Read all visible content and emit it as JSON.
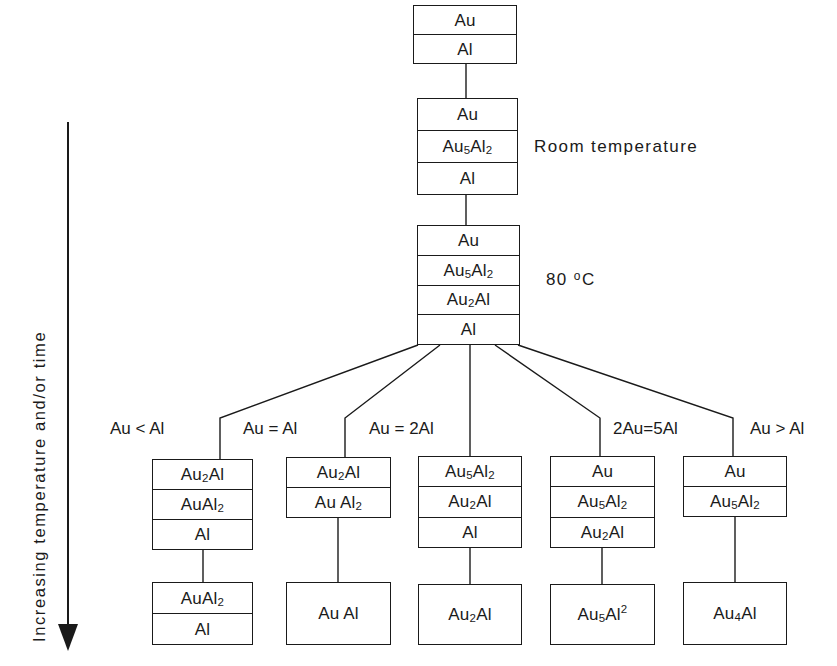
{
  "figure": {
    "axis_caption": "Increasing temperature and/or time",
    "arrow_direction": "down"
  },
  "annotations": {
    "room_temperature": "Room temperature",
    "eighty_c_value": "80 ",
    "eighty_c_deg": "o",
    "eighty_c_unit": "C"
  },
  "conditions": [
    {
      "id": "au-lt-al",
      "label": "Au < Al"
    },
    {
      "id": "au-eq-al",
      "label": "Au = Al"
    },
    {
      "id": "au-eq-2al",
      "label": "Au = 2Al"
    },
    {
      "id": "2au-eq-5al",
      "label": "2Au=5Al"
    },
    {
      "id": "au-gt-al",
      "label": "Au > Al"
    }
  ],
  "trunk": [
    {
      "id": "stack-1",
      "layers": [
        {
          "base": "Au",
          "sub": "",
          "tail": ""
        },
        {
          "base": "Al",
          "sub": "",
          "tail": ""
        }
      ]
    },
    {
      "id": "stack-2",
      "layers": [
        {
          "base": "Au",
          "sub": "",
          "tail": ""
        },
        {
          "base": "Au",
          "sub": "5",
          "tail": "Al",
          "sub2": "2"
        },
        {
          "base": "Al",
          "sub": "",
          "tail": ""
        }
      ]
    },
    {
      "id": "stack-3",
      "layers": [
        {
          "base": "Au",
          "sub": "",
          "tail": ""
        },
        {
          "base": "Au",
          "sub": "5",
          "tail": "Al",
          "sub2": "2"
        },
        {
          "base": "Au",
          "sub": "2",
          "tail": "Al",
          "sub2": ""
        },
        {
          "base": "Al",
          "sub": "",
          "tail": ""
        }
      ]
    }
  ],
  "branches": [
    {
      "id": "branch-1",
      "condition": "Au < Al",
      "upper": [
        {
          "base": "Au",
          "sub": "2",
          "tail": "Al",
          "sub2": ""
        },
        {
          "base": "AuAl",
          "sub": "2",
          "tail": "",
          "sub2": ""
        },
        {
          "base": "Al",
          "sub": "",
          "tail": "",
          "sub2": ""
        }
      ],
      "lower": [
        {
          "base": "AuAl",
          "sub": "2",
          "tail": "",
          "sub2": ""
        },
        {
          "base": "Al",
          "sub": "",
          "tail": "",
          "sub2": ""
        }
      ]
    },
    {
      "id": "branch-2",
      "condition": "Au = Al",
      "upper": [
        {
          "base": "Au",
          "sub": "2",
          "tail": "Al",
          "sub2": ""
        },
        {
          "base": "Au Al",
          "sub": "2",
          "tail": "",
          "sub2": ""
        }
      ],
      "lower": [
        {
          "base": "Au Al",
          "sub": "",
          "tail": "",
          "sub2": ""
        }
      ]
    },
    {
      "id": "branch-3",
      "condition": "Au = 2Al",
      "upper": [
        {
          "base": "Au",
          "sub": "5",
          "tail": "Al",
          "sub2": "2"
        },
        {
          "base": "Au",
          "sub": "2",
          "tail": "Al",
          "sub2": ""
        },
        {
          "base": "Al",
          "sub": "",
          "tail": "",
          "sub2": ""
        }
      ],
      "lower": [
        {
          "base": "Au",
          "sub": "2",
          "tail": "Al",
          "sub2": ""
        }
      ]
    },
    {
      "id": "branch-4",
      "condition": "2Au=5Al",
      "upper": [
        {
          "base": "Au",
          "sub": "",
          "tail": "",
          "sub2": ""
        },
        {
          "base": "Au",
          "sub": "5",
          "tail": "Al",
          "sub2": "2"
        },
        {
          "base": "Au",
          "sub": "2",
          "tail": "Al",
          "sub2": ""
        }
      ],
      "lower": [
        {
          "base": "Au",
          "sub": "5",
          "tail": "Al",
          "supTail": "2"
        }
      ]
    },
    {
      "id": "branch-5",
      "condition": "Au > Al",
      "upper": [
        {
          "base": "Au",
          "sub": "",
          "tail": "",
          "sub2": ""
        },
        {
          "base": "Au",
          "sub": "5",
          "tail": "Al",
          "sub2": "2"
        }
      ],
      "lower": [
        {
          "base": "Au",
          "sub": "4",
          "tail": "Al",
          "sub2": ""
        }
      ]
    }
  ],
  "colors": {
    "ink": "#1a1a1a",
    "paper": "#ffffff"
  }
}
